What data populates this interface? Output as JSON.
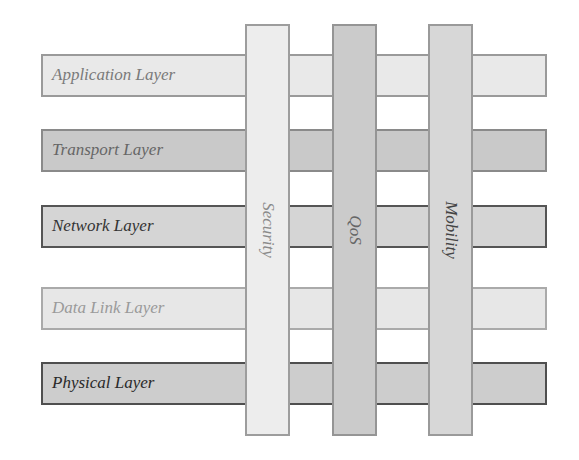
{
  "diagram": {
    "layers": [
      {
        "label": "Application Layer",
        "fill": "#e9e9e9",
        "border": "#9a9a9a",
        "text": "#7a7a7a"
      },
      {
        "label": "Transport Layer",
        "fill": "#c9c9c9",
        "border": "#8a8a8a",
        "text": "#666666"
      },
      {
        "label": "Network Layer",
        "fill": "#d5d5d5",
        "border": "#555555",
        "text": "#333333"
      },
      {
        "label": "Data Link Layer",
        "fill": "#e7e7e7",
        "border": "#aaaaaa",
        "text": "#9a9a9a"
      },
      {
        "label": "Physical Layer",
        "fill": "#cdcdcd",
        "border": "#4f4f4f",
        "text": "#2a2a2a"
      }
    ],
    "cross_cutting": [
      {
        "label": "Security",
        "fill": "#ededed",
        "border": "#9d9d9d",
        "text": "#8a8a8a"
      },
      {
        "label": "QoS",
        "fill": "#cbcbcb",
        "border": "#959595",
        "text": "#666666"
      },
      {
        "label": "Mobility",
        "fill": "#d7d7d7",
        "border": "#9a9a9a",
        "text": "#444444"
      }
    ]
  }
}
